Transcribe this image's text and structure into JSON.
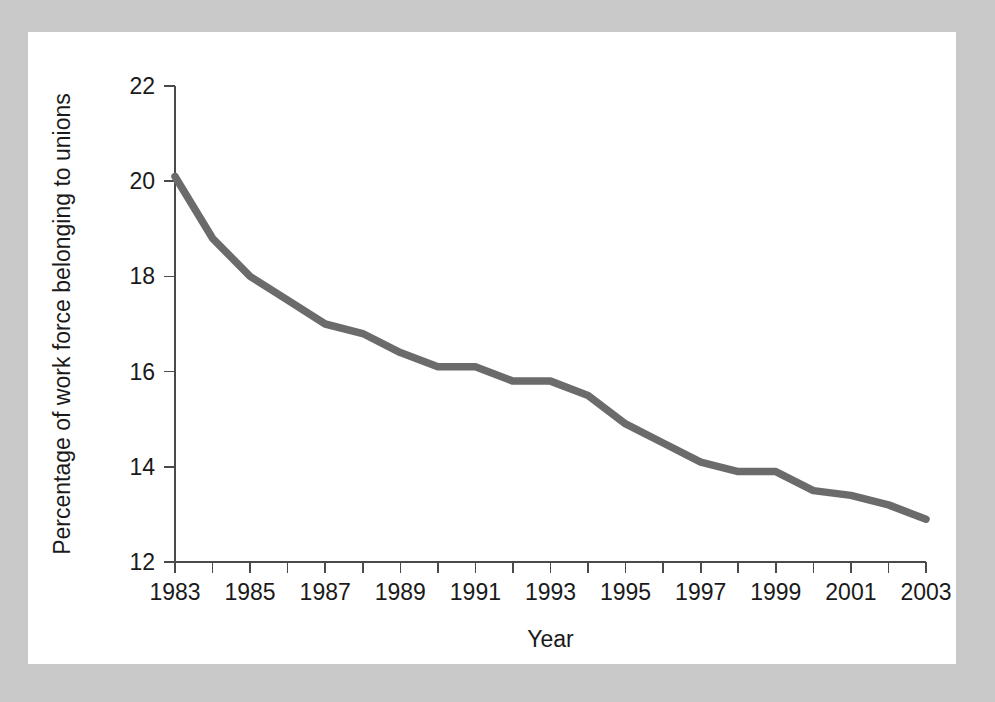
{
  "figure": {
    "background_color": "#c9c9c9",
    "card_color": "#ffffff"
  },
  "chart_data": {
    "type": "line",
    "title": "",
    "xlabel": "Year",
    "ylabel": "Percentage of work force belonging to unions",
    "xlim": [
      1983,
      2003
    ],
    "ylim": [
      12,
      22
    ],
    "grid": false,
    "legend": "none",
    "line_color": "#6b6b6b",
    "axis_color": "#4a4a4a",
    "x_tick_labels": [
      "1983",
      "1985",
      "1987",
      "1989",
      "1991",
      "1993",
      "1995",
      "1997",
      "1999",
      "2001",
      "2003"
    ],
    "x_tick_values": [
      1983,
      1985,
      1987,
      1989,
      1991,
      1993,
      1995,
      1997,
      1999,
      2001,
      2003
    ],
    "x_minor_ticks": [
      1984,
      1986,
      1988,
      1990,
      1992,
      1994,
      1996,
      1998,
      2000,
      2002
    ],
    "y_tick_labels": [
      "12",
      "14",
      "16",
      "18",
      "20",
      "22"
    ],
    "y_tick_values": [
      12,
      14,
      16,
      18,
      20,
      22
    ],
    "x": [
      1983,
      1984,
      1985,
      1986,
      1987,
      1988,
      1989,
      1990,
      1991,
      1992,
      1993,
      1994,
      1995,
      1996,
      1997,
      1998,
      1999,
      2000,
      2001,
      2002,
      2003
    ],
    "values": [
      20.1,
      18.8,
      18.0,
      17.5,
      17.0,
      16.8,
      16.4,
      16.1,
      16.1,
      15.8,
      15.8,
      15.5,
      14.9,
      14.5,
      14.1,
      13.9,
      13.9,
      13.5,
      13.4,
      13.2,
      12.9
    ],
    "series": [
      {
        "name": "Union membership",
        "values": [
          20.1,
          18.8,
          18.0,
          17.5,
          17.0,
          16.8,
          16.4,
          16.1,
          16.1,
          15.8,
          15.8,
          15.5,
          14.9,
          14.5,
          14.1,
          13.9,
          13.9,
          13.5,
          13.4,
          13.2,
          12.9
        ]
      }
    ]
  }
}
